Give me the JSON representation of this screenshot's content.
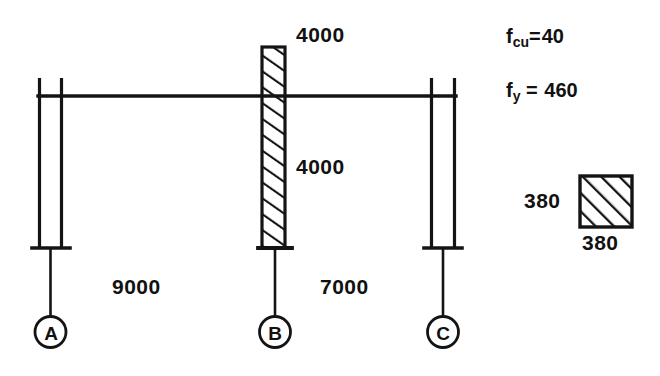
{
  "diagram": {
    "stroke_color": "#141414",
    "background_color": "#ffffff",
    "beam": {
      "label": "beam-line"
    },
    "columns": [
      {
        "grid": "A",
        "name": "column-a",
        "hatched": false
      },
      {
        "grid": "B",
        "name": "column-b",
        "hatched": true
      },
      {
        "grid": "C",
        "name": "column-c",
        "hatched": false
      }
    ],
    "grid_marks": [
      {
        "label": "A"
      },
      {
        "label": "B"
      },
      {
        "label": "C"
      }
    ],
    "dimensions": {
      "upper_column_height": "4000",
      "lower_column_height": "4000",
      "span_ab": "9000",
      "span_bc": "7000"
    },
    "materials": {
      "concrete_symbol": "f",
      "concrete_subscript": "cu",
      "concrete_equals": "=",
      "concrete_value": "40",
      "steel_symbol": "f",
      "steel_subscript": "y",
      "steel_equals": "=",
      "steel_value": "460"
    },
    "section": {
      "name": "column-cross-section",
      "width_label": "380",
      "depth_label": "380"
    }
  }
}
